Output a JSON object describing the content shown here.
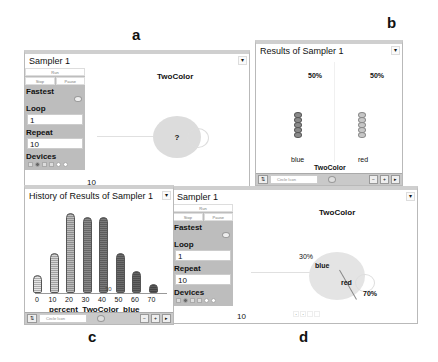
{
  "figure_labels": {
    "a": "a",
    "b": "b",
    "c": "c",
    "d": "d"
  },
  "panel_a": {
    "title": "Sampler 1",
    "run_label": "Run",
    "stop_label": "Stop",
    "pause_label": "Pause",
    "speed_label": "Fastest",
    "loop_label": "Loop",
    "loop_value": "1",
    "repeat_label": "Repeat",
    "repeat_value": "10",
    "devices_label": "Devices",
    "stage_title": "TwoColor",
    "spinner_symbol": "?",
    "count": "10",
    "menu_icon": "▾"
  },
  "panel_b": {
    "title": "Results of Sampler 1",
    "columns": [
      {
        "label": "blue",
        "percent": "50%",
        "beads": 5
      },
      {
        "label": "red",
        "percent": "50%",
        "beads": 5
      }
    ],
    "axis_title": "TwoColor",
    "toolbar": {
      "select_value": "Circle Icon",
      "minus": "−",
      "plus": "+",
      "play": "▸"
    },
    "menu_icon": "▾"
  },
  "panel_c": {
    "title": "History of Results of Sampler 1",
    "axis_title": "percent_TwoColor_blue",
    "marker_label": "30",
    "toolbar": {
      "select_value": "Circle Icon",
      "minus": "−",
      "plus": "+",
      "play": "▸"
    },
    "menu_icon": "▾"
  },
  "panel_d": {
    "title": "Sampler 1",
    "run_label": "Run",
    "stop_label": "Stop",
    "pause_label": "Pause",
    "speed_label": "Fastest",
    "loop_label": "Loop",
    "loop_value": "1",
    "repeat_label": "Repeat",
    "repeat_value": "10",
    "devices_label": "Devices",
    "stage_title": "TwoColor",
    "count": "10",
    "pie": {
      "blue_label": "blue",
      "blue_percent": "30%",
      "red_label": "red",
      "red_percent": "70%"
    },
    "menu_icon": "▾"
  },
  "chart_data": {
    "type": "bar",
    "title": "History of Results of Sampler 1",
    "xlabel": "percent_TwoColor_blue",
    "ylabel": "",
    "categories": [
      "0",
      "10",
      "20",
      "30",
      "40",
      "50",
      "60",
      "70"
    ],
    "values": [
      4,
      9,
      18,
      17,
      17,
      9,
      5,
      2
    ],
    "marker": {
      "x": 30,
      "label": "30"
    },
    "grid": false
  }
}
